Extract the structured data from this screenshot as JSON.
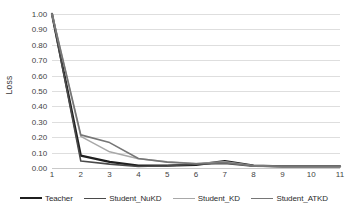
{
  "chart_data": {
    "type": "line",
    "title": "",
    "xlabel": "",
    "ylabel": "Loss",
    "x": [
      1,
      2,
      3,
      4,
      5,
      6,
      7,
      8,
      9,
      10,
      11
    ],
    "categories": [
      "1",
      "2",
      "3",
      "4",
      "5",
      "6",
      "7",
      "8",
      "9",
      "10",
      "11"
    ],
    "xlim": [
      1,
      11
    ],
    "ylim": [
      0.0,
      1.0
    ],
    "ytick_labels": [
      "0.00",
      "0.10",
      "0.20",
      "0.30",
      "0.40",
      "0.50",
      "0.60",
      "0.70",
      "0.80",
      "0.90",
      "1.00"
    ],
    "ytick_values": [
      0.0,
      0.1,
      0.2,
      0.3,
      0.4,
      0.5,
      0.6,
      0.7,
      0.8,
      0.9,
      1.0
    ],
    "grid": true,
    "grid_axis": "y",
    "legend_position": "bottom",
    "series": [
      {
        "name": "Teacher",
        "color": "#1f1f1f",
        "width": 2.3,
        "values": [
          1.0,
          0.08,
          0.04,
          0.015,
          0.015,
          0.02,
          0.045,
          0.015,
          0.01,
          0.01,
          0.01
        ]
      },
      {
        "name": "Student_NuKD",
        "color": "#4a4a4a",
        "width": 1.6,
        "values": [
          1.0,
          0.045,
          0.025,
          0.01,
          0.015,
          0.025,
          0.03,
          0.012,
          0.01,
          0.01,
          0.01
        ]
      },
      {
        "name": "Student_KD",
        "color": "#a8a8a8",
        "width": 1.5,
        "values": [
          1.0,
          0.205,
          0.105,
          0.06,
          0.04,
          0.03,
          0.04,
          0.015,
          0.01,
          0.01,
          0.01
        ]
      },
      {
        "name": "Student_ATKD",
        "color": "#767676",
        "width": 1.6,
        "values": [
          1.0,
          0.215,
          0.165,
          0.062,
          0.038,
          0.028,
          0.035,
          0.014,
          0.01,
          0.01,
          0.01
        ]
      }
    ]
  },
  "legend": {
    "items": [
      {
        "label": "Teacher"
      },
      {
        "label": "Student_NuKD"
      },
      {
        "label": "Student_KD"
      },
      {
        "label": "Student_ATKD"
      }
    ]
  }
}
